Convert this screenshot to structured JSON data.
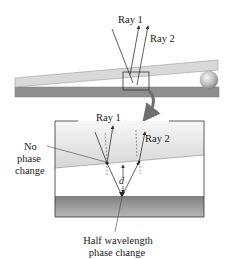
{
  "diagram": {
    "top_view": {
      "ray1_label": "Ray 1",
      "ray2_label": "Ray 2",
      "spacer": "sphere"
    },
    "inset": {
      "ray1_label": "Ray 1",
      "ray2_label": "Ray 2",
      "gap_label": "d",
      "top_reflection_label_line1": "No",
      "top_reflection_label_line2": "phase",
      "top_reflection_label_line3": "change",
      "bottom_reflection_label_line1": "Half wavelength",
      "bottom_reflection_label_line2": "phase change"
    },
    "colors": {
      "top_plate": "#d9d9d9",
      "bottom_plate": "#8f8f8f",
      "inset_top_glass": "#e6e6e6",
      "inset_bottom_glass": "#9a9a9a",
      "ray": "#333333",
      "zoom_arrow": "#6e6e6e"
    }
  }
}
